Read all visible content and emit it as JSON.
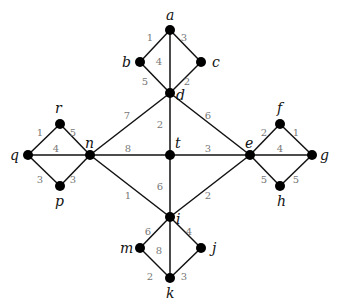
{
  "graph": {
    "nodes": [
      {
        "id": "a",
        "x": 170,
        "y": 30,
        "lx": 166,
        "ly": 20
      },
      {
        "id": "b",
        "x": 140,
        "y": 62,
        "lx": 122,
        "ly": 67
      },
      {
        "id": "c",
        "x": 201,
        "y": 62,
        "lx": 212,
        "ly": 67
      },
      {
        "id": "d",
        "x": 170,
        "y": 93,
        "lx": 176,
        "ly": 100
      },
      {
        "id": "t",
        "x": 170,
        "y": 155,
        "lx": 175,
        "ly": 148
      },
      {
        "id": "n",
        "x": 90,
        "y": 155,
        "lx": 85,
        "ly": 148
      },
      {
        "id": "e",
        "x": 250,
        "y": 155,
        "lx": 245,
        "ly": 148
      },
      {
        "id": "i",
        "x": 170,
        "y": 217,
        "lx": 176,
        "ly": 224
      },
      {
        "id": "r",
        "x": 60,
        "y": 124,
        "lx": 55,
        "ly": 113
      },
      {
        "id": "q",
        "x": 28,
        "y": 155,
        "lx": 10,
        "ly": 160
      },
      {
        "id": "p",
        "x": 60,
        "y": 186,
        "lx": 55,
        "ly": 206
      },
      {
        "id": "f",
        "x": 280,
        "y": 124,
        "lx": 277,
        "ly": 113
      },
      {
        "id": "g",
        "x": 312,
        "y": 155,
        "lx": 320,
        "ly": 160
      },
      {
        "id": "h",
        "x": 280,
        "y": 186,
        "lx": 277,
        "ly": 206
      },
      {
        "id": "m",
        "x": 140,
        "y": 248,
        "lx": 120,
        "ly": 253
      },
      {
        "id": "j",
        "x": 201,
        "y": 248,
        "lx": 212,
        "ly": 253
      },
      {
        "id": "k",
        "x": 170,
        "y": 278,
        "lx": 166,
        "ly": 298
      }
    ],
    "edges": [
      {
        "from": "a",
        "to": "b",
        "w": "1",
        "wx": 150,
        "wy": 41
      },
      {
        "from": "a",
        "to": "c",
        "w": "3",
        "wx": 184,
        "wy": 41
      },
      {
        "from": "a",
        "to": "d",
        "w": "4",
        "wx": 159,
        "wy": 65
      },
      {
        "from": "b",
        "to": "d",
        "w": "5",
        "wx": 145,
        "wy": 85
      },
      {
        "from": "c",
        "to": "d",
        "w": "2",
        "wx": 187,
        "wy": 85
      },
      {
        "from": "d",
        "to": "n",
        "w": "7",
        "wx": 127,
        "wy": 119
      },
      {
        "from": "d",
        "to": "e",
        "w": "6",
        "wx": 208,
        "wy": 119
      },
      {
        "from": "d",
        "to": "t",
        "w": "2",
        "wx": 160,
        "wy": 128
      },
      {
        "from": "n",
        "to": "t",
        "w": "8",
        "wx": 128,
        "wy": 152
      },
      {
        "from": "t",
        "to": "e",
        "w": "3",
        "wx": 208,
        "wy": 152
      },
      {
        "from": "t",
        "to": "i",
        "w": "6",
        "wx": 160,
        "wy": 190
      },
      {
        "from": "n",
        "to": "i",
        "w": "1",
        "wx": 128,
        "wy": 199
      },
      {
        "from": "e",
        "to": "i",
        "w": "2",
        "wx": 208,
        "wy": 199
      },
      {
        "from": "q",
        "to": "r",
        "w": "1",
        "wx": 40,
        "wy": 136
      },
      {
        "from": "r",
        "to": "n",
        "w": "5",
        "wx": 73,
        "wy": 136
      },
      {
        "from": "q",
        "to": "n",
        "w": "4",
        "wx": 56,
        "wy": 152
      },
      {
        "from": "q",
        "to": "p",
        "w": "3",
        "wx": 40,
        "wy": 183
      },
      {
        "from": "p",
        "to": "n",
        "w": "3",
        "wx": 73,
        "wy": 183
      },
      {
        "from": "e",
        "to": "f",
        "w": "2",
        "wx": 264,
        "wy": 136
      },
      {
        "from": "f",
        "to": "g",
        "w": "1",
        "wx": 296,
        "wy": 136
      },
      {
        "from": "e",
        "to": "g",
        "w": "4",
        "wx": 280,
        "wy": 152
      },
      {
        "from": "e",
        "to": "h",
        "w": "5",
        "wx": 264,
        "wy": 183
      },
      {
        "from": "h",
        "to": "g",
        "w": "5",
        "wx": 296,
        "wy": 183
      },
      {
        "from": "i",
        "to": "m",
        "w": "6",
        "wx": 148,
        "wy": 235
      },
      {
        "from": "i",
        "to": "j",
        "w": "4",
        "wx": 189,
        "wy": 235
      },
      {
        "from": "i",
        "to": "k",
        "w": "8",
        "wx": 159,
        "wy": 254
      },
      {
        "from": "m",
        "to": "k",
        "w": "2",
        "wx": 150,
        "wy": 280
      },
      {
        "from": "j",
        "to": "k",
        "w": "3",
        "wx": 184,
        "wy": 280
      }
    ]
  }
}
